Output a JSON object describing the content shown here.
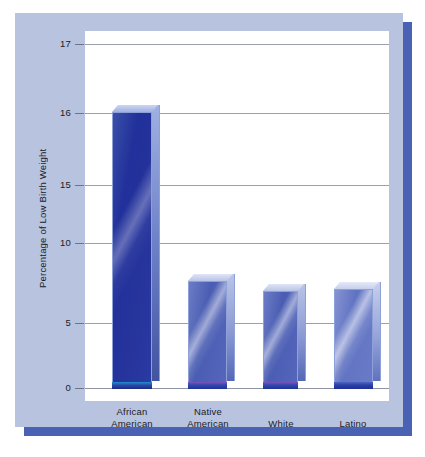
{
  "chart_data": {
    "type": "bar",
    "title": "",
    "subtitle": "",
    "xlabel": "",
    "ylabel": "Percentage of Low Birth Weight",
    "categories": [
      "African American",
      "Native American",
      "White",
      "Latino"
    ],
    "values": [
      16.05,
      7.9,
      7.1,
      7.4
    ],
    "series": [
      {
        "name": "Percentage of Low Birth Weight",
        "values": [
          16.05,
          7.9,
          7.1,
          7.4
        ]
      }
    ],
    "ytick_labels": [
      "17",
      "16",
      "15",
      "10",
      "5",
      "0"
    ],
    "ytick_values": [
      17,
      16,
      15,
      10,
      5,
      0
    ],
    "ylim": [
      0,
      17
    ],
    "axis_note": "non-linear y-axis: compressed between 0 and 15, expanded between 15 and 17",
    "grid": true,
    "legend": false,
    "legend_position": "none",
    "colors": {
      "bar_dark": "#26349c",
      "bar_mid": "#4a5db2",
      "bar_light": "#6073c2",
      "card_background": "#b8c3e0",
      "card_shadow": "#4a62b4",
      "plot_background": "#ffffff",
      "gridline": "#9aa0ab",
      "text": "#1b1b25"
    }
  },
  "axis": {
    "ticks": [
      {
        "label": "17",
        "y": 31
      },
      {
        "label": "16",
        "y": 100
      },
      {
        "label": "15",
        "y": 172
      },
      {
        "label": "10",
        "y": 230
      },
      {
        "label": "5",
        "y": 310
      },
      {
        "label": "0",
        "y": 375
      }
    ]
  },
  "bars": [
    {
      "name": "african-american",
      "label": "African American",
      "tone": "dark",
      "left": 27,
      "width": 40,
      "top": 99,
      "height": 276
    },
    {
      "name": "native-american",
      "label": "Native American",
      "tone": "mid",
      "left": 103,
      "width": 39,
      "top": 268,
      "height": 107
    },
    {
      "name": "white",
      "label": "White",
      "tone": "mid",
      "left": 178,
      "width": 35,
      "top": 278,
      "height": 97
    },
    {
      "name": "latino",
      "label": "Latino",
      "tone": "light",
      "left": 249,
      "width": 39,
      "top": 276,
      "height": 99
    }
  ],
  "category_labels": [
    {
      "name": "african-american",
      "line1": "African",
      "line2": "American",
      "center": 47,
      "two_line": true
    },
    {
      "name": "native-american",
      "line1": "Native",
      "line2": "American",
      "center": 123,
      "two_line": true
    },
    {
      "name": "white",
      "line1": "White",
      "line2": "",
      "center": 196,
      "two_line": false
    },
    {
      "name": "latino",
      "line1": "Latino",
      "line2": "",
      "center": 268,
      "two_line": false
    }
  ]
}
